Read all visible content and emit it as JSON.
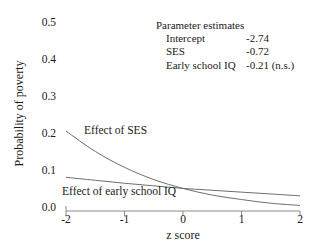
{
  "chart_data": {
    "type": "line",
    "title": "",
    "xlabel": "z score",
    "ylabel": "Probability of poverty",
    "xlim": [
      -2,
      2
    ],
    "ylim": [
      0.0,
      0.5
    ],
    "xticks": [
      "-2",
      "-1",
      "0",
      "1",
      "2"
    ],
    "xtick_values": [
      -2,
      -1,
      0,
      1,
      2
    ],
    "yticks": [
      "0.0",
      "0.1",
      "0.2",
      "0.3",
      "0.4",
      "0.5"
    ],
    "ytick_values": [
      0.0,
      0.1,
      0.2,
      0.3,
      0.4,
      0.5
    ],
    "grid": false,
    "legend_position": "inline-annotations",
    "x": [
      -2,
      -1.5,
      -1,
      -0.5,
      0,
      0.5,
      1,
      1.5,
      2
    ],
    "series": [
      {
        "name": "Effect of SES",
        "label": "Effect of SES",
        "color": "#6e6e6e",
        "values": [
          0.216,
          0.161,
          0.118,
          0.085,
          0.061,
          0.043,
          0.031,
          0.021,
          0.015
        ]
      },
      {
        "name": "Effect of early school IQ",
        "label": "Effect of early school IQ",
        "color": "#6e6e6e",
        "values": [
          0.091,
          0.083,
          0.075,
          0.068,
          0.061,
          0.056,
          0.051,
          0.046,
          0.041
        ]
      }
    ],
    "annotations": [
      "Parameter estimates",
      "Intercept -2.74",
      "SES -0.72",
      "Early school IQ -0.21 (n.s.)"
    ]
  },
  "axes": {
    "y_title": "Probability of poverty",
    "x_title": "z score",
    "y_tick_labels": [
      "0.5",
      "0.4",
      "0.3",
      "0.2",
      "0.1",
      "0.0"
    ],
    "x_tick_labels": [
      "-2",
      "-1",
      "0",
      "1",
      "2"
    ]
  },
  "parameter_estimates": {
    "title": "Parameter estimates",
    "rows": [
      {
        "name": "Intercept",
        "value": "-2.74"
      },
      {
        "name": "SES",
        "value": "-0.72"
      },
      {
        "name": "Early school IQ",
        "value": "-0.21 (n.s.)"
      }
    ]
  },
  "curve_labels": {
    "ses": "Effect of SES",
    "iq": "Effect of early school IQ"
  },
  "colors": {
    "curve": "#6e6e6e",
    "axis": "#8a8a8a",
    "text": "#1a1a1a",
    "background": "#ffffff"
  }
}
